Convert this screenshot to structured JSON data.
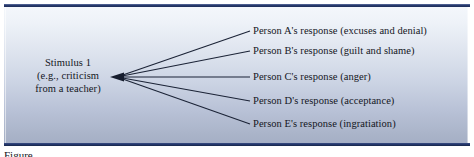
{
  "figure": {
    "stimulus": {
      "lines": [
        "Stimulus 1",
        "(e.g., criticism",
        "from a teacher)"
      ]
    },
    "responses": [
      {
        "label": "Person A's response (excuses and denial)"
      },
      {
        "label": "Person B's response (guilt and shame)"
      },
      {
        "label": "Person C's response (anger)"
      },
      {
        "label": "Person D's response (acceptance)"
      },
      {
        "label": "Person E's response (ingratiation)"
      }
    ],
    "caption": "Figure",
    "colors": {
      "rule": "#2c3f73",
      "panel_top": "#f4f7fb",
      "panel_bottom": "#a9b3c8",
      "line": "#1b2336",
      "text": "#14161d"
    }
  }
}
